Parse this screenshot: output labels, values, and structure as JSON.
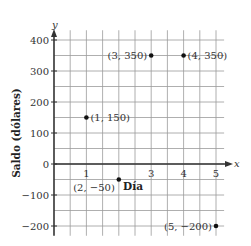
{
  "chart_data": {
    "type": "scatter",
    "title": "",
    "xlabel": "Día",
    "ylabel": "Saldo (dólares)",
    "x_axis_name": "x",
    "y_axis_name": "y",
    "xlim": [
      0,
      5.25
    ],
    "ylim": [
      -225,
      425
    ],
    "x_ticks": [
      "1",
      "3",
      "4",
      "5"
    ],
    "y_ticks": [
      "400",
      "300",
      "200",
      "100",
      "0",
      "−100",
      "−200"
    ],
    "grid": true,
    "grid_step_x": 0.5,
    "grid_step_y": 50,
    "points": [
      {
        "x": 1,
        "y": 150,
        "label": "(1, 150)"
      },
      {
        "x": 2,
        "y": -50,
        "label": "(2, −50)"
      },
      {
        "x": 3,
        "y": 350,
        "label": "(3, 350)"
      },
      {
        "x": 4,
        "y": 350,
        "label": "(4, 350)"
      },
      {
        "x": 5,
        "y": -200,
        "label": "(5, −200)"
      }
    ]
  },
  "colors": {
    "grid": "#9a9a9a",
    "axis": "#333333",
    "point": "#111111"
  }
}
